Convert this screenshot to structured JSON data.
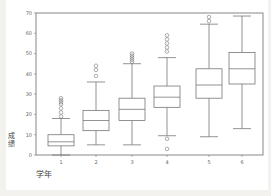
{
  "chart_data": {
    "type": "box",
    "title": "",
    "xlabel": "学年",
    "ylabel": "成绩",
    "ylim": [
      0,
      70
    ],
    "yticks": [
      0,
      10,
      20,
      30,
      40,
      50,
      60,
      70
    ],
    "categories": [
      "1",
      "2",
      "3",
      "4",
      "5",
      "6"
    ],
    "grid": false,
    "series": [
      {
        "name": "1",
        "whisker_low": 0,
        "q1": 4.5,
        "median": 6.5,
        "q3": 10,
        "whisker_high": 18,
        "outliers": [
          19,
          21,
          23,
          25,
          26,
          27,
          28
        ]
      },
      {
        "name": "2",
        "whisker_low": 5,
        "q1": 12,
        "median": 17,
        "q3": 22,
        "whisker_high": 36,
        "outliers": [
          39,
          42,
          44
        ]
      },
      {
        "name": "3",
        "whisker_low": 5,
        "q1": 17,
        "median": 22.5,
        "q3": 28,
        "whisker_high": 45,
        "outliers": [
          46,
          47,
          48,
          49,
          50
        ]
      },
      {
        "name": "4",
        "whisker_low": 9.5,
        "q1": 23.5,
        "median": 28.5,
        "q3": 34,
        "whisker_high": 48,
        "outliers": [
          8,
          3,
          51,
          53,
          55,
          57,
          59
        ]
      },
      {
        "name": "5",
        "whisker_low": 9,
        "q1": 28,
        "median": 34.5,
        "q3": 42.5,
        "whisker_high": 64.5,
        "outliers": [
          66,
          68
        ]
      },
      {
        "name": "6",
        "whisker_low": 13,
        "q1": 35,
        "median": 42.5,
        "q3": 50.5,
        "whisker_high": 68.5,
        "outliers": []
      }
    ]
  },
  "labels": {
    "xlabel": "学年",
    "ylabel": "成绩",
    "yticks": [
      "0",
      "10",
      "20",
      "30",
      "40",
      "50",
      "60",
      "70"
    ],
    "xticks": [
      "1",
      "2",
      "3",
      "4",
      "5",
      "6"
    ]
  },
  "colors": {
    "axis": "#888888",
    "box": "#777777",
    "background": "#ffffff"
  }
}
